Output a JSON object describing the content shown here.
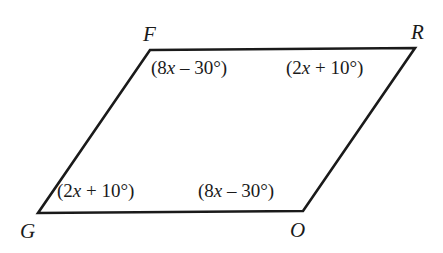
{
  "figure": {
    "kind": "parallelogram",
    "name": "FROG",
    "stroke_color": "#1a1a1a",
    "background_color": "#ffffff",
    "stroke_width": 2.6,
    "vertices": [
      {
        "label": "F",
        "x": 150,
        "y": 50
      },
      {
        "label": "R",
        "x": 415,
        "y": 48
      },
      {
        "label": "O",
        "x": 303,
        "y": 211
      },
      {
        "label": "G",
        "x": 38,
        "y": 213
      }
    ],
    "vertex_labels": {
      "F": "F",
      "R": "R",
      "O": "O",
      "G": "G"
    },
    "angle_labels": {
      "F": {
        "prefix": "(8",
        "var": "x",
        "suffix": " – 30°)"
      },
      "R": {
        "prefix": "(2",
        "var": "x",
        "suffix": " + 10°)"
      },
      "G": {
        "prefix": "(2",
        "var": "x",
        "suffix": " + 10°)"
      },
      "O": {
        "prefix": "(8",
        "var": "x",
        "suffix": " – 30°)"
      }
    },
    "angle_labels_plain": {
      "F": "(8x – 30°)",
      "R": "(2x + 10°)",
      "G": "(2x + 10°)",
      "O": "(8x – 30°)"
    }
  }
}
